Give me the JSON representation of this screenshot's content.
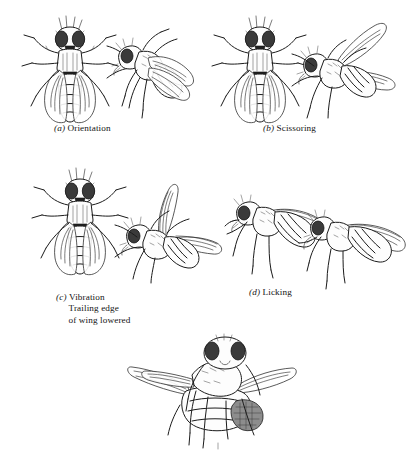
{
  "figure": {
    "type": "scientific-line-illustration",
    "style": "black-and-white pen-and-ink drawing",
    "background_color": "#ffffff",
    "ink_color": "#1b1b1b"
  },
  "panels": [
    {
      "id": "a",
      "label": "(a)",
      "label_letter": "a",
      "name": "Orientation",
      "caption": "(a) Orientation",
      "extra_lines": [],
      "figures": [
        {
          "view": "dorsal",
          "role": "female",
          "wings": "folded over abdomen"
        },
        {
          "view": "oblique-lateral",
          "role": "male",
          "wings": "folded, angled toward female"
        }
      ]
    },
    {
      "id": "b",
      "label": "(b)",
      "label_letter": "b",
      "name": "Scissoring",
      "caption": "(b) Scissoring",
      "extra_lines": [],
      "figures": [
        {
          "view": "dorsal",
          "role": "female",
          "wings": "folded over abdomen"
        },
        {
          "view": "dorsal-oblique",
          "role": "male",
          "wings": "both wings spread apart in a V"
        }
      ]
    },
    {
      "id": "c",
      "label": "(c)",
      "label_letter": "c",
      "name": "Vibration",
      "caption": "(c) Vibration",
      "extra_lines": [
        "Trailing edge",
        "of wing lowered"
      ],
      "figures": [
        {
          "view": "dorsal",
          "role": "female",
          "wings": "folded over abdomen"
        },
        {
          "view": "oblique",
          "role": "male",
          "wings": "one wing raised vertically, one extended"
        }
      ]
    },
    {
      "id": "d",
      "label": "(d)",
      "label_letter": "d",
      "name": "Licking",
      "caption": "(d) Licking",
      "extra_lines": [],
      "figures": [
        {
          "view": "lateral",
          "role": "female",
          "wings": "folded along body"
        },
        {
          "view": "lateral",
          "role": "male",
          "wings": "folded, head at female abdomen tip"
        }
      ]
    },
    {
      "id": "e",
      "label": "",
      "label_letter": "",
      "name": "Copulation",
      "caption": "",
      "extra_lines": [],
      "figures": [
        {
          "view": "frontal-oblique",
          "role": "pair",
          "wings": "male mounted on female"
        }
      ]
    }
  ]
}
